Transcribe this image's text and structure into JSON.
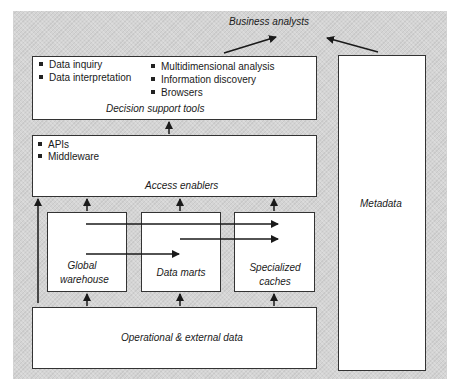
{
  "diagram": {
    "top_label": "Business analysts",
    "decision_support": {
      "title": "Decision support tools",
      "left_items": [
        "Data inquiry",
        "Data interpretation"
      ],
      "right_items": [
        "Multidimensional analysis",
        "Information discovery",
        "Browsers"
      ]
    },
    "access_enablers": {
      "title": "Access enablers",
      "items": [
        "APIs",
        "Middleware"
      ]
    },
    "stores": {
      "global_warehouse": "Global warehouse",
      "data_marts": "Data marts",
      "specialized_caches": "Specialized caches"
    },
    "operational": {
      "title": "Operational & external data"
    },
    "metadata": {
      "title": "Metadata"
    }
  },
  "colors": {
    "background": "#d4d4d4",
    "box": "#ffffff",
    "line": "#1a1a1a"
  }
}
